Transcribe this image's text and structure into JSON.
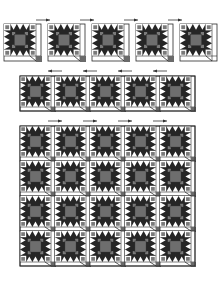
{
  "colors": {
    "background": "#ffffff",
    "outline": "#2a2a2a",
    "star_dark": "#262626",
    "center_gray": "#6e6e6e",
    "accent_gray": "#7a7a7a",
    "sashing": "#ffffff",
    "cornerstone": "#6a6a6a",
    "arrow": "#333333"
  },
  "block_size": 32,
  "sash_width": 3,
  "sections": [
    {
      "name": "row-1-separate-blocks",
      "type": "separate",
      "blocks": [
        {
          "x": 4,
          "y": 24,
          "cornerstone": true
        },
        {
          "x": 48,
          "y": 24,
          "cornerstone": true
        },
        {
          "x": 92,
          "y": 24,
          "cornerstone": true
        },
        {
          "x": 136,
          "y": 24,
          "cornerstone": true
        },
        {
          "x": 180,
          "y": 24,
          "cornerstone": false
        }
      ],
      "arrows": [
        {
          "x1": 36,
          "x2": 50,
          "y": 20,
          "dir": "right"
        },
        {
          "x1": 80,
          "x2": 94,
          "y": 20,
          "dir": "right"
        },
        {
          "x1": 124,
          "x2": 138,
          "y": 20,
          "dir": "right"
        },
        {
          "x1": 168,
          "x2": 182,
          "y": 20,
          "dir": "right"
        }
      ]
    },
    {
      "name": "row-2-joined-strip",
      "type": "strip",
      "x": 20,
      "y": 76,
      "cols": 5,
      "rows": 1,
      "cell": 35,
      "arrows": [
        {
          "x1": 48,
          "x2": 62,
          "y": 71,
          "dir": "left"
        },
        {
          "x1": 83,
          "x2": 97,
          "y": 71,
          "dir": "left"
        },
        {
          "x1": 118,
          "x2": 132,
          "y": 71,
          "dir": "left"
        },
        {
          "x1": 153,
          "x2": 167,
          "y": 71,
          "dir": "left"
        }
      ]
    },
    {
      "name": "quilt-top-grid",
      "type": "grid",
      "x": 20,
      "y": 126,
      "cols": 5,
      "rows": 4,
      "cell": 35,
      "arrows": [
        {
          "x1": 48,
          "x2": 62,
          "y": 121,
          "dir": "right"
        },
        {
          "x1": 83,
          "x2": 97,
          "y": 121,
          "dir": "right"
        },
        {
          "x1": 118,
          "x2": 132,
          "y": 121,
          "dir": "right"
        },
        {
          "x1": 153,
          "x2": 167,
          "y": 121,
          "dir": "right"
        }
      ]
    }
  ]
}
